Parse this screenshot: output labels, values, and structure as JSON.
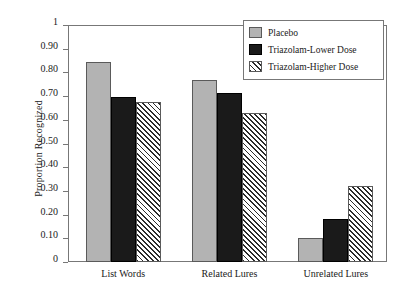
{
  "chart_data": {
    "type": "bar",
    "title": "",
    "xlabel": "",
    "ylabel": "Proportion Recognized",
    "ylim": [
      0,
      1
    ],
    "ytick_labels": [
      "1",
      "0.90",
      "0.80",
      "0.70",
      "0.60",
      "0.50",
      "0.40",
      "0.30",
      "0.20",
      "0.10",
      "0"
    ],
    "ytick_values": [
      1,
      0.9,
      0.8,
      0.7,
      0.6,
      0.5,
      0.4,
      0.3,
      0.2,
      0.1,
      0
    ],
    "grid": false,
    "legend_position": "top-right",
    "categories": [
      "List Words",
      "Related Lures",
      "Unrelated Lures"
    ],
    "series": [
      {
        "name": "Placebo",
        "color": "#b3b3b3",
        "fill": "solid-gray",
        "values": [
          0.845,
          0.77,
          0.1
        ]
      },
      {
        "name": "Triazolam-Lower Dose",
        "color": "#1a1a1a",
        "fill": "solid-black",
        "values": [
          0.695,
          0.715,
          0.18
        ]
      },
      {
        "name": "Triazolam-Higher Dose",
        "color": "#2b2b2b",
        "fill": "diagonal-hatch",
        "values": [
          0.675,
          0.63,
          0.32
        ]
      }
    ]
  }
}
